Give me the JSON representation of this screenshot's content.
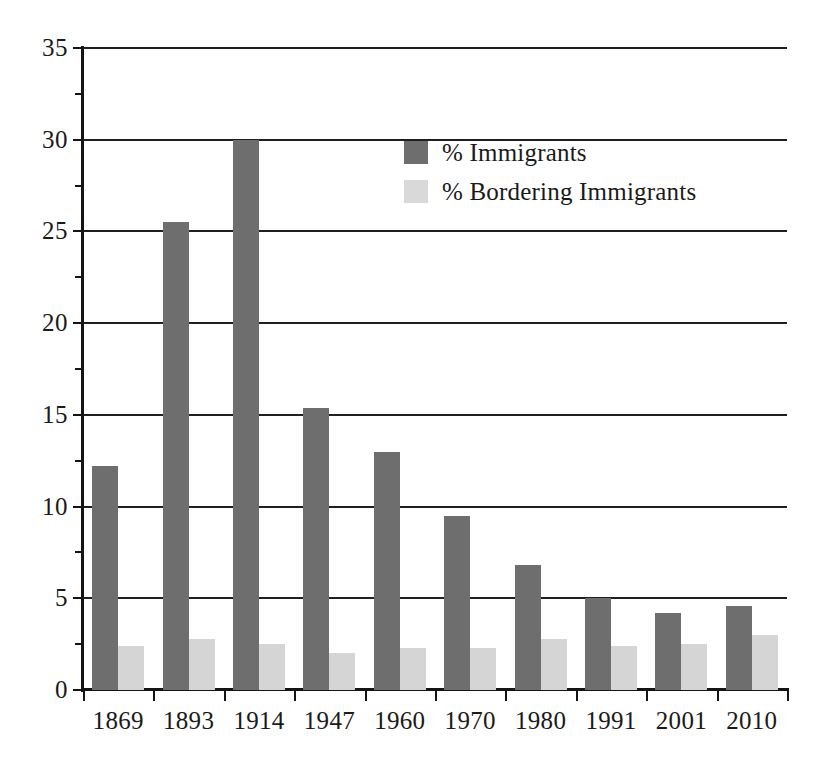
{
  "chart_data": {
    "type": "bar",
    "title": "",
    "xlabel": "",
    "ylabel": "",
    "categories": [
      "1869",
      "1893",
      "1914",
      "1947",
      "1960",
      "1970",
      "1980",
      "1991",
      "2001",
      "2010"
    ],
    "series": [
      {
        "name": "% Immigrants",
        "color": "#6e6e6e",
        "values": [
          12.2,
          25.5,
          30.0,
          15.4,
          13.0,
          9.5,
          6.8,
          5.0,
          4.2,
          4.6
        ]
      },
      {
        "name": "% Bordering Immigrants",
        "color": "#d5d5d5",
        "values": [
          2.4,
          2.8,
          2.5,
          2.0,
          2.3,
          2.3,
          2.8,
          2.4,
          2.5,
          3.0
        ]
      }
    ],
    "ylim": [
      0,
      35
    ],
    "ytick_values": [
      0,
      5,
      10,
      15,
      20,
      25,
      30,
      35
    ],
    "ytick_labels": [
      "0",
      "5",
      "10",
      "15",
      "20",
      "25",
      "30",
      "35"
    ],
    "yminor_values": [
      2.5,
      7.5,
      12.5,
      17.5,
      22.5,
      27.5,
      32.5
    ],
    "grid": true,
    "grid_axis": "y",
    "legend_position": "upper center"
  },
  "legend": {
    "entries": [
      {
        "label": "% Immigrants",
        "swatch": "dark"
      },
      {
        "label": "% Bordering Immigrants",
        "swatch": "light"
      }
    ]
  },
  "colors": {
    "series_dark": "#6e6e6e",
    "series_light": "#d5d5d5",
    "axis": "#141414",
    "background": "#ffffff"
  }
}
